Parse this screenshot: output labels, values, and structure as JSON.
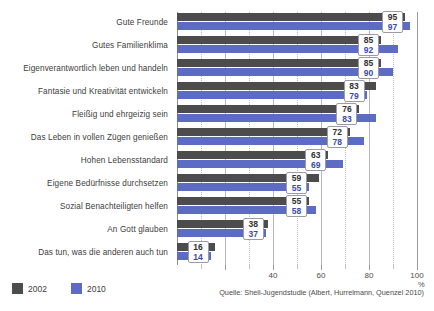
{
  "chart_data": {
    "type": "bar",
    "orientation": "horizontal",
    "title": "",
    "xlabel": "%",
    "ylabel": "",
    "xlim": [
      0,
      100
    ],
    "xticks": [
      40,
      60,
      80,
      100
    ],
    "xtick_labels": [
      "40",
      "60",
      "80",
      "100"
    ],
    "grid": true,
    "legend_position": "bottom-left",
    "categories": [
      "Gute Freunde",
      "Gutes Familienklima",
      "Eigenverantwortlich leben und handeln",
      "Fantasie und Kreativität entwickeln",
      "Fleißig und ehrgeizig sein",
      "Das Leben in vollen Zügen genießen",
      "Hohen Lebensstandard",
      "Eigene Bedürfnisse durchsetzen",
      "Sozial Benachteiligten helfen",
      "An Gott glauben",
      "Das tun, was die anderen auch tun"
    ],
    "series": [
      {
        "name": "2002",
        "color": "#4c4c4c",
        "values": [
          95,
          85,
          85,
          83,
          76,
          72,
          63,
          59,
          55,
          38,
          16
        ]
      },
      {
        "name": "2010",
        "color": "#5c6cc4",
        "values": [
          97,
          92,
          90,
          79,
          83,
          78,
          69,
          55,
          58,
          37,
          14
        ]
      }
    ],
    "annotation": "Quelle: Shell-Jugendstudie (Albert, Hurrelmann, Quenzel 2010)"
  },
  "legend": {
    "items": [
      {
        "label": "2002",
        "color": "#4c4c4c"
      },
      {
        "label": "2010",
        "color": "#5c6cc4"
      }
    ]
  },
  "axis": {
    "unit": "%"
  },
  "source": {
    "text": "Quelle: Shell-Jugendstudie (Albert, Hurrelmann, Quenzel 2010)"
  }
}
